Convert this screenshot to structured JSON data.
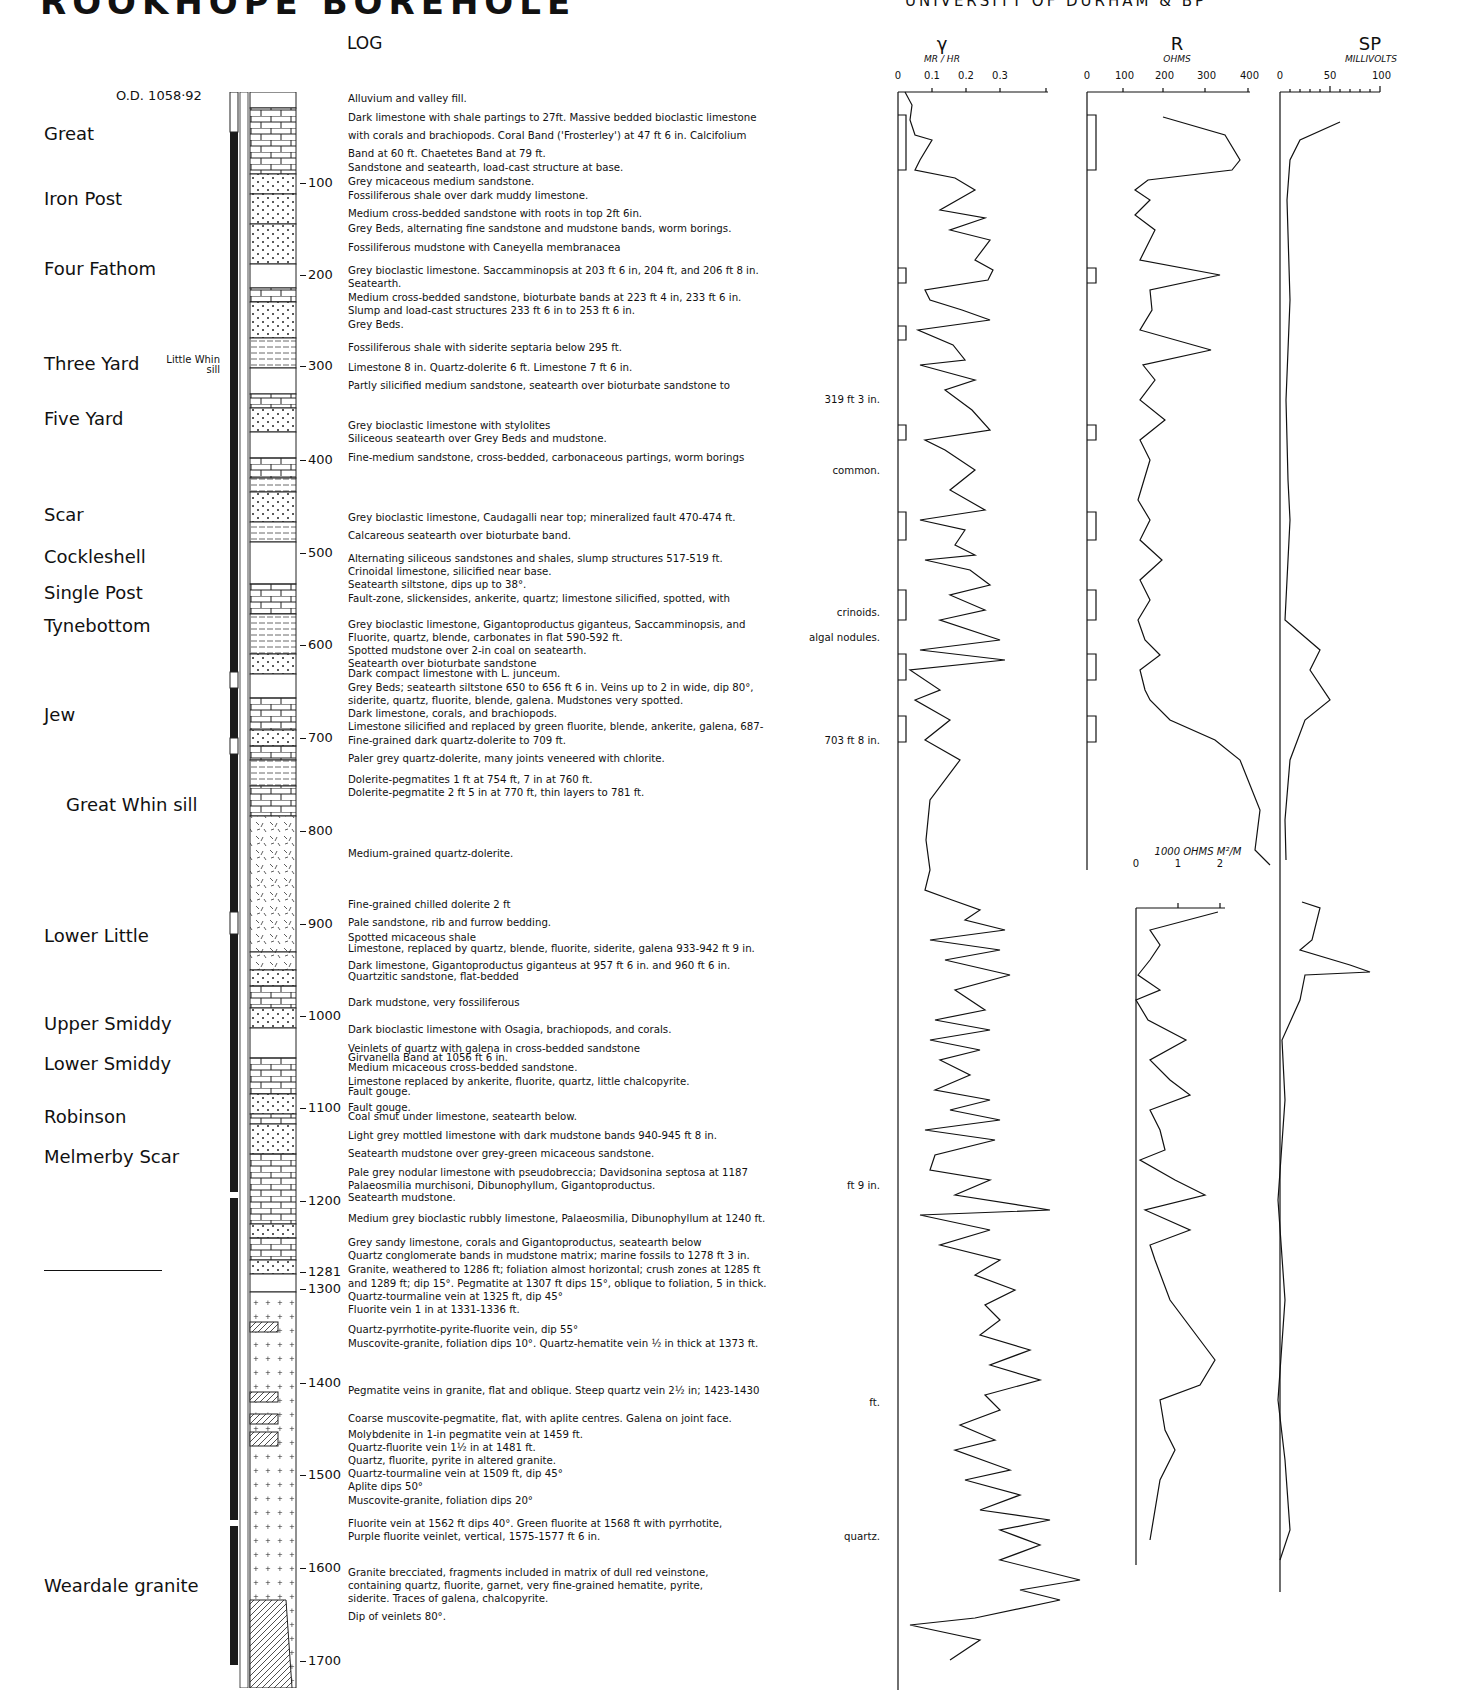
{
  "header": {
    "title": "ROOKHOPE BOREHOLE",
    "subtitle": "UNIVERSITY OF DURHAM & BP"
  },
  "log": {
    "heading": "LOG",
    "ordnance_datum": "O.D. 1058·92",
    "column_labels": [
      "CORE",
      "MARINE"
    ]
  },
  "members": [
    {
      "name": "Great",
      "y": 135
    },
    {
      "name": "Iron Post",
      "y": 200
    },
    {
      "name": "Four Fathom",
      "y": 270
    },
    {
      "name": "Three Yard",
      "y": 365,
      "annotation": "Little Whin sill"
    },
    {
      "name": "Five Yard",
      "y": 420
    },
    {
      "name": "Scar",
      "y": 516
    },
    {
      "name": "Cockleshell",
      "y": 558
    },
    {
      "name": "Single Post",
      "y": 594
    },
    {
      "name": "Tynebottom",
      "y": 627
    },
    {
      "name": "Jew",
      "y": 716
    },
    {
      "name": "Great Whin sill",
      "y": 806,
      "indent": true
    },
    {
      "name": "Lower Little",
      "y": 937
    },
    {
      "name": "Upper Smiddy",
      "y": 1025
    },
    {
      "name": "Lower Smiddy",
      "y": 1065
    },
    {
      "name": "Robinson",
      "y": 1118
    },
    {
      "name": "Melmerby Scar",
      "y": 1158
    },
    {
      "name": "Weardale granite",
      "y": 1587
    }
  ],
  "depth_ticks": [
    {
      "label": "100",
      "y": 183
    },
    {
      "label": "200",
      "y": 275
    },
    {
      "label": "300",
      "y": 366
    },
    {
      "label": "400",
      "y": 460
    },
    {
      "label": "500",
      "y": 553
    },
    {
      "label": "600",
      "y": 645
    },
    {
      "label": "700",
      "y": 738
    },
    {
      "label": "800",
      "y": 831
    },
    {
      "label": "900",
      "y": 924
    },
    {
      "label": "1000",
      "y": 1016
    },
    {
      "label": "1100",
      "y": 1108
    },
    {
      "label": "1200",
      "y": 1201
    },
    {
      "label": "1281",
      "y": 1272
    },
    {
      "label": "1300",
      "y": 1289
    },
    {
      "label": "1400",
      "y": 1383
    },
    {
      "label": "1500",
      "y": 1475
    },
    {
      "label": "1600",
      "y": 1568
    },
    {
      "label": "1700",
      "y": 1661
    }
  ],
  "descriptions": [
    {
      "y": 101,
      "text": "Alluvium and valley fill."
    },
    {
      "y": 120,
      "text": "Dark limestone with shale partings to 27ft. Massive bedded bioclastic limestone"
    },
    {
      "y": 138,
      "text": "with corals and brachiopods. Coral Band ('Frosterley') at 47 ft 6 in. Calcifolium"
    },
    {
      "y": 156,
      "text": "Band at 60 ft. Chaetetes Band at 79 ft."
    },
    {
      "y": 170,
      "text": "Sandstone and seatearth, load-cast structure at base."
    },
    {
      "y": 184,
      "text": "Grey micaceous medium sandstone."
    },
    {
      "y": 198,
      "text": "Fossiliferous shale over dark muddy limestone."
    },
    {
      "y": 216,
      "text": "Medium cross-bedded sandstone with roots in top 2ft 6in."
    },
    {
      "y": 231,
      "text": "Grey Beds, alternating fine sandstone and mudstone bands, worm borings."
    },
    {
      "y": 250,
      "text": "Fossiliferous mudstone with Caneyella membranacea"
    },
    {
      "y": 273,
      "text": "Grey bioclastic limestone. Saccamminopsis at 203 ft 6 in, 204 ft, and 206 ft 8 in."
    },
    {
      "y": 286,
      "text": "Seatearth."
    },
    {
      "y": 300,
      "text": "Medium cross-bedded sandstone, bioturbate bands at 223 ft 4 in, 233 ft 6 in."
    },
    {
      "y": 313,
      "text": "Slump and load-cast structures 233 ft 6 in to 253 ft 6 in."
    },
    {
      "y": 327,
      "text": "Grey Beds."
    },
    {
      "y": 350,
      "text": "Fossiliferous shale with siderite septaria below 295 ft."
    },
    {
      "y": 370,
      "text": "Limestone 8 in. Quartz-dolerite 6 ft. Limestone 7 ft 6 in."
    },
    {
      "y": 388,
      "text": "Partly silicified medium sandstone, seatearth over bioturbate sandstone to"
    },
    {
      "y": 402,
      "text": "319 ft 3 in.",
      "right": true
    },
    {
      "y": 428,
      "text": "Grey bioclastic limestone with stylolites"
    },
    {
      "y": 441,
      "text": "Siliceous seatearth over Grey Beds and mudstone."
    },
    {
      "y": 460,
      "text": "Fine-medium sandstone, cross-bedded, carbonaceous partings, worm borings"
    },
    {
      "y": 473,
      "text": "common.",
      "right": true
    },
    {
      "y": 520,
      "text": "Grey bioclastic limestone, Caudagalli near top; mineralized fault 470-474 ft."
    },
    {
      "y": 538,
      "text": "Calcareous seatearth over bioturbate band."
    },
    {
      "y": 561,
      "text": "Alternating siliceous sandstones and shales, slump structures 517-519 ft."
    },
    {
      "y": 574,
      "text": "Crinoidal limestone, silicified near base."
    },
    {
      "y": 587,
      "text": "Seatearth siltstone, dips up to 38°."
    },
    {
      "y": 601,
      "text": "Fault-zone, slickensides, ankerite, quartz; limestone silicified, spotted, with"
    },
    {
      "y": 615,
      "text": "crinoids.",
      "right": true
    },
    {
      "y": 627,
      "text": "Grey bioclastic limestone, Gigantoproductus giganteus, Saccamminopsis, and"
    },
    {
      "y": 640,
      "text": "Fluorite, quartz, blende, carbonates in flat 590-592 ft."
    },
    {
      "y": 640,
      "text": "algal nodules.",
      "right": true
    },
    {
      "y": 653,
      "text": "Spotted mudstone over 2-in coal on seatearth."
    },
    {
      "y": 666,
      "text": "Seatearth over bioturbate sandstone"
    },
    {
      "y": 676,
      "text": "Dark compact limestone with L. junceum."
    },
    {
      "y": 690,
      "text": "Grey Beds; seatearth siltstone 650 to 656 ft 6 in. Veins up to 2 in wide, dip 80°,"
    },
    {
      "y": 703,
      "text": "siderite, quartz, fluorite, blende, galena. Mudstones very spotted."
    },
    {
      "y": 716,
      "text": "Dark limestone, corals, and brachiopods."
    },
    {
      "y": 729,
      "text": "Limestone silicified and replaced by green fluorite, blende, ankerite, galena, 687-"
    },
    {
      "y": 743,
      "text": "Fine-grained dark quartz-dolerite to 709 ft."
    },
    {
      "y": 743,
      "text": "703 ft 8 in.",
      "right": true
    },
    {
      "y": 761,
      "text": "Paler grey quartz-dolerite, many joints veneered with chlorite."
    },
    {
      "y": 782,
      "text": "Dolerite-pegmatites 1 ft at 754 ft, 7 in at 760 ft."
    },
    {
      "y": 795,
      "text": "Dolerite-pegmatite 2 ft 5 in at 770 ft, thin layers to 781 ft."
    },
    {
      "y": 856,
      "text": "Medium-grained quartz-dolerite."
    },
    {
      "y": 907,
      "text": "Fine-grained chilled dolerite 2 ft"
    },
    {
      "y": 925,
      "text": "Pale sandstone, rib and furrow bedding."
    },
    {
      "y": 940,
      "text": "Spotted micaceous shale"
    },
    {
      "y": 951,
      "text": "Limestone, replaced by quartz, blende, fluorite, siderite, galena 933-942 ft 9 in."
    },
    {
      "y": 968,
      "text": "Dark limestone, Gigantoproductus giganteus at 957 ft 6 in. and 960 ft 6 in."
    },
    {
      "y": 979,
      "text": "Quartzitic sandstone, flat-bedded"
    },
    {
      "y": 1005,
      "text": "Dark mudstone, very fossiliferous"
    },
    {
      "y": 1032,
      "text": "Dark bioclastic limestone with Osagia, brachiopods, and corals."
    },
    {
      "y": 1051,
      "text": "Veinlets of quartz with galena in cross-bedded sandstone"
    },
    {
      "y": 1060,
      "text": "Girvanella Band at 1056 ft 6 in."
    },
    {
      "y": 1070,
      "text": "Medium micaceous cross-bedded sandstone."
    },
    {
      "y": 1084,
      "text": "Limestone replaced by ankerite, fluorite, quartz, little chalcopyrite."
    },
    {
      "y": 1094,
      "text": "Fault gouge."
    },
    {
      "y": 1110,
      "text": "Fault gouge."
    },
    {
      "y": 1119,
      "text": "Coal smut under limestone, seatearth below."
    },
    {
      "y": 1138,
      "text": "Light grey mottled limestone with dark mudstone bands 940-945 ft 8 in."
    },
    {
      "y": 1156,
      "text": "Seatearth mudstone over grey-green micaceous sandstone."
    },
    {
      "y": 1175,
      "text": "Pale grey nodular limestone with pseudobreccia; Davidsonina septosa at 1187"
    },
    {
      "y": 1188,
      "text": "Palaeosmilia murchisoni, Dibunophyllum, Gigantoproductus."
    },
    {
      "y": 1188,
      "text": "ft 9 in.",
      "right": true
    },
    {
      "y": 1200,
      "text": "Seatearth mudstone."
    },
    {
      "y": 1221,
      "text": "Medium grey bioclastic rubbly limestone, Palaeosmilia, Dibunophyllum at 1240 ft."
    },
    {
      "y": 1245,
      "text": "Grey sandy limestone, corals and Gigantoproductus, seatearth below"
    },
    {
      "y": 1258,
      "text": "Quartz conglomerate bands in mudstone matrix; marine fossils to 1278 ft 3 in."
    },
    {
      "y": 1272,
      "text": "Granite, weathered to 1286 ft; foliation almost horizontal; crush zones at 1285 ft"
    },
    {
      "y": 1286,
      "text": "and 1289 ft; dip 15°. Pegmatite at 1307 ft dips 15°, oblique to foliation, 5 in thick."
    },
    {
      "y": 1299,
      "text": "Quartz-tourmaline vein at 1325 ft, dip 45°"
    },
    {
      "y": 1312,
      "text": "Fluorite vein 1 in at 1331-1336 ft."
    },
    {
      "y": 1332,
      "text": "Quartz-pyrrhotite-pyrite-fluorite vein, dip 55°"
    },
    {
      "y": 1346,
      "text": "Muscovite-granite, foliation dips 10°. Quartz-hematite vein ½ in thick at 1373 ft."
    },
    {
      "y": 1393,
      "text": "Pegmatite veins in granite, flat and oblique. Steep quartz vein 2½ in; 1423-1430"
    },
    {
      "y": 1405,
      "text": "ft.",
      "right": true
    },
    {
      "y": 1421,
      "text": "Coarse muscovite-pegmatite, flat, with aplite centres. Galena on joint face."
    },
    {
      "y": 1437,
      "text": "Molybdenite in 1-in pegmatite vein at 1459 ft."
    },
    {
      "y": 1450,
      "text": "Quartz-fluorite vein 1½ in at 1481 ft."
    },
    {
      "y": 1463,
      "text": "Quartz, fluorite, pyrite in altered granite."
    },
    {
      "y": 1476,
      "text": "Quartz-tourmaline vein at 1509 ft, dip 45°"
    },
    {
      "y": 1489,
      "text": "Aplite dips 50°"
    },
    {
      "y": 1503,
      "text": "Muscovite-granite, foliation dips 20°"
    },
    {
      "y": 1526,
      "text": "Fluorite vein at 1562 ft dips 40°. Green fluorite at 1568 ft with pyrrhotite,"
    },
    {
      "y": 1539,
      "text": "Purple fluorite veinlet, vertical, 1575-1577 ft 6 in."
    },
    {
      "y": 1539,
      "text": "quartz.",
      "right": true
    },
    {
      "y": 1575,
      "text": "Granite brecciated, fragments included in matrix of dull red veinstone,"
    },
    {
      "y": 1588,
      "text": "containing quartz, fluorite, garnet, very fine-grained hematite, pyrite,"
    },
    {
      "y": 1601,
      "text": "siderite. Traces of galena, chalcopyrite."
    },
    {
      "y": 1619,
      "text": "Dip of veinlets 80°."
    }
  ],
  "tracks": {
    "gamma": {
      "symbol": "γ",
      "unit": "MR / HR",
      "ticks": [
        "0",
        "0.1",
        "0.2",
        "0.3"
      ]
    },
    "resistivity": {
      "symbol": "R",
      "unit": "OHMS",
      "ticks": [
        "0",
        "100",
        "200",
        "300",
        "400"
      ],
      "lower_unit": "1000 OHMS M²/M",
      "lower_ticks": [
        "0",
        "1",
        "2"
      ]
    },
    "sp": {
      "symbol": "SP",
      "unit": "MILLIVOLTS",
      "ticks": [
        "0",
        "50",
        "100"
      ]
    }
  },
  "chart_data": {
    "type": "line",
    "ylabel": "Depth (ft)",
    "ylim": [
      0,
      1700
    ],
    "series": [
      {
        "name": "Gamma (MR/HR)",
        "xlim": [
          0,
          0.3
        ],
        "depth": [
          20,
          60,
          110,
          150,
          200,
          250,
          300,
          350,
          400,
          450,
          500,
          550,
          600,
          650,
          700,
          760,
          800,
          900,
          950,
          1000,
          1050,
          1100,
          1150,
          1200,
          1250,
          1300,
          1350,
          1400,
          1450,
          1500,
          1550,
          1600,
          1650,
          1700
        ],
        "values": [
          0.03,
          0.05,
          0.18,
          0.08,
          0.2,
          0.15,
          0.05,
          0.18,
          0.08,
          0.12,
          0.05,
          0.12,
          0.22,
          0.05,
          0.1,
          0.03,
          0.04,
          0.2,
          0.12,
          0.18,
          0.06,
          0.22,
          0.05,
          0.25,
          0.15,
          0.2,
          0.18,
          0.25,
          0.15,
          0.2,
          0.12,
          0.32,
          0.2,
          0.08
        ]
      },
      {
        "name": "Resistivity (OHMS)",
        "xlim": [
          0,
          400
        ],
        "depth": [
          40,
          70,
          100,
          150,
          200,
          250,
          300,
          350,
          400,
          450,
          500,
          550,
          600,
          650,
          700,
          750,
          800,
          850
        ],
        "values": [
          200,
          400,
          50,
          60,
          200,
          80,
          250,
          50,
          100,
          60,
          120,
          60,
          100,
          60,
          50,
          200,
          380,
          300
        ]
      },
      {
        "name": "Resistivity (1000 OHMS M²/M)",
        "xlim": [
          0,
          2.5
        ],
        "depth": [
          900,
          920,
          950,
          1000,
          1050,
          1100,
          1150,
          1200,
          1250,
          1300,
          1350,
          1400,
          1450,
          1500,
          1530
        ],
        "values": [
          2.0,
          0.8,
          0.1,
          1.7,
          0.5,
          1.6,
          0.2,
          2.3,
          0.8,
          0.3,
          0.7,
          2.5,
          1.2,
          1.5,
          1.2
        ]
      },
      {
        "name": "SP (MILLIVOLTS)",
        "xlim": [
          0,
          100
        ],
        "depth": [
          40,
          100,
          200,
          400,
          600,
          650,
          700,
          750,
          800,
          850,
          900,
          950,
          1000,
          1100,
          1200,
          1300,
          1400,
          1500,
          1530
        ],
        "values": [
          90,
          5,
          5,
          5,
          5,
          -5,
          40,
          25,
          10,
          5,
          100,
          140,
          60,
          20,
          10,
          0,
          -5,
          -10,
          -15
        ]
      }
    ]
  }
}
